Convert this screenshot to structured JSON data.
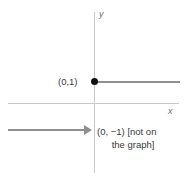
{
  "figure": {
    "type": "coordinate-plane-graph",
    "axes": {
      "y_label": "y",
      "x_label": "x"
    },
    "points": [
      {
        "name": "included-endpoint",
        "label": "(0,1)",
        "filled": true
      },
      {
        "name": "excluded-endpoint",
        "label": "(0, −1)",
        "note": "[not on",
        "note_line2": "the graph]"
      }
    ],
    "colors": {
      "axis": "#c9c9c9",
      "ray": "#8f8f8f",
      "dot": "#111111",
      "text": "#3a3a3a",
      "background": "#ffffff"
    }
  },
  "chart_data": {
    "type": "line",
    "title": "",
    "xlabel": "x",
    "ylabel": "y",
    "grid": false,
    "legend": null,
    "series": [
      {
        "name": "upper-ray",
        "comment": "horizontal ray at y = 1, starting at x = 0 (closed endpoint), extending to the right",
        "y": 1,
        "x_start": 0,
        "x_end": 4.5,
        "endpoint_closed": true
      },
      {
        "name": "lower-ray",
        "comment": "horizontal ray at y = -1, extending leftward from x = 0 (open/excluded endpoint)",
        "y": -1,
        "x_start": -4.6,
        "x_end": 0,
        "endpoint_closed": false
      }
    ],
    "annotations": [
      {
        "text": "(0,1)",
        "x": 0,
        "y": 1
      },
      {
        "text": "(0, −1) [not on the graph]",
        "x": 0,
        "y": -1
      }
    ]
  }
}
